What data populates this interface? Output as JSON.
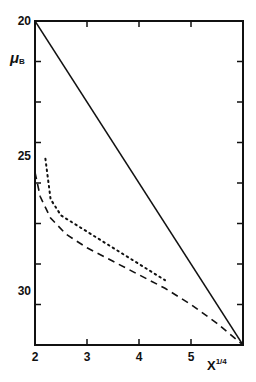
{
  "chart_data": {
    "type": "line",
    "title": "",
    "xlabel": "X",
    "xlabel_superscript": "1/4",
    "ylabel": "μ",
    "ylabel_subscript": "B",
    "xlim": [
      2,
      6
    ],
    "ylim": [
      32,
      20
    ],
    "y_inverted": true,
    "grid": false,
    "legend": null,
    "x_ticks": [
      2,
      3,
      4,
      5
    ],
    "x_tick_labels": [
      "2",
      "3",
      "4",
      "5"
    ],
    "y_ticks": [
      20,
      25,
      30
    ],
    "y_tick_labels": [
      "20",
      "25",
      "30"
    ],
    "series": [
      {
        "name": "solid",
        "style": "solid",
        "x": [
          2.0,
          6.0
        ],
        "y": [
          20.0,
          32.0
        ]
      },
      {
        "name": "dotted",
        "style": "dotted",
        "x": [
          2.2,
          2.3,
          2.5,
          3.0,
          3.5,
          4.0,
          4.5
        ],
        "y": [
          25.1,
          26.6,
          27.2,
          27.8,
          28.4,
          29.0,
          29.6
        ]
      },
      {
        "name": "dashed",
        "style": "dashed",
        "x": [
          2.0,
          2.1,
          2.3,
          2.6,
          3.0,
          3.5,
          4.0,
          4.5,
          5.0,
          5.5,
          6.0
        ],
        "y": [
          25.6,
          26.5,
          27.3,
          27.9,
          28.4,
          28.9,
          29.4,
          29.9,
          30.5,
          31.2,
          32.0
        ]
      }
    ]
  }
}
